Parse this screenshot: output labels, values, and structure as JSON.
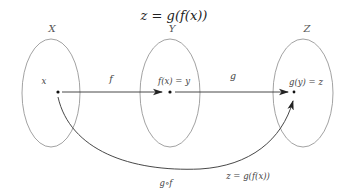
{
  "title": "z = g(f(x))",
  "sets": [
    {
      "name": "X",
      "element_label": "x"
    },
    {
      "name": "Y",
      "element_label": "f(x) = y"
    },
    {
      "name": "Z",
      "element_label": "g(y) = z"
    }
  ],
  "maps": {
    "f": "f",
    "g": "g",
    "composition": "g∘f",
    "composition_result": "z = g(f(x))"
  },
  "colors": {
    "ellipse": "#888888",
    "arrow": "#333333",
    "text": "#333333"
  }
}
